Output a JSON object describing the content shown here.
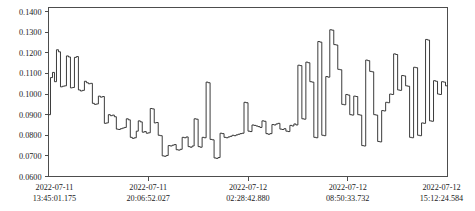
{
  "chart_data": {
    "type": "line",
    "line_style": "step-post",
    "title": "",
    "subtitle": "",
    "xlabel": "",
    "ylabel": "",
    "grid": false,
    "legend": null,
    "legend_position": "none",
    "series_color": "#262626",
    "background_color": "#ffffff",
    "axis_color": "#4d4d4d",
    "ylim": [
      0.06,
      0.142
    ],
    "yticks": [
      0.06,
      0.07,
      0.08,
      0.09,
      0.1,
      0.11,
      0.12,
      0.13,
      0.14
    ],
    "ytick_labels": [
      "0.0600",
      "0.0700",
      "0.0800",
      "0.0900",
      "0.1000",
      "0.1100",
      "0.1200",
      "0.1300",
      "0.1400"
    ],
    "xtick_labels": [
      {
        "date": "2022-07-11",
        "time": "13:45:01.175"
      },
      {
        "date": "2022-07-11",
        "time": "20:06:52.027"
      },
      {
        "date": "2022-07-12",
        "time": "02:28:42.880"
      },
      {
        "date": "2022-07-12",
        "time": "08:50:33.732"
      },
      {
        "date": "2022-07-12",
        "time": "15:12:24.584"
      }
    ],
    "xtick_positions": [
      0,
      0.25,
      0.5,
      0.75,
      1.0
    ],
    "x_range_start": "2022-07-11 13:45:01.175",
    "x_range_end": "2022-07-12 15:12:24.584",
    "n_points": 200,
    "value_min": 0.0655,
    "value_max": 0.1312,
    "values": [
      0.09,
      0.108,
      0.1105,
      0.106,
      0.1215,
      0.1205,
      0.1035,
      0.1038,
      0.104,
      0.1185,
      0.118,
      0.103,
      0.1032,
      0.1178,
      0.1182,
      0.102,
      0.1015,
      0.1018,
      0.1062,
      0.1055,
      0.105,
      0.1052,
      0.0955,
      0.095,
      0.0952,
      0.099,
      0.0985,
      0.0988,
      0.0858,
      0.086,
      0.09,
      0.0895,
      0.0898,
      0.089,
      0.083,
      0.0828,
      0.0832,
      0.0835,
      0.0838,
      0.088,
      0.0875,
      0.079,
      0.0785,
      0.0788,
      0.082,
      0.087,
      0.0865,
      0.0815,
      0.0818,
      0.081,
      0.0812,
      0.093,
      0.0928,
      0.086,
      0.0862,
      0.08,
      0.0798,
      0.07,
      0.0698,
      0.0702,
      0.075,
      0.0748,
      0.0752,
      0.0755,
      0.073,
      0.0728,
      0.0732,
      0.079,
      0.0788,
      0.0792,
      0.0745,
      0.0742,
      0.0748,
      0.088,
      0.0878,
      0.0745,
      0.0742,
      0.079,
      0.0788,
      0.1058,
      0.1055,
      0.078,
      0.0778,
      0.069,
      0.0688,
      0.0692,
      0.081,
      0.0808,
      0.079,
      0.0788,
      0.0792,
      0.0795,
      0.08,
      0.0798,
      0.0802,
      0.0805,
      0.0808,
      0.081,
      0.096,
      0.0958,
      0.082,
      0.0818,
      0.085,
      0.0848,
      0.0845,
      0.0842,
      0.0838,
      0.087,
      0.0868,
      0.0808,
      0.0805,
      0.0808,
      0.0852,
      0.085,
      0.0855,
      0.0858,
      0.083,
      0.0828,
      0.0832,
      0.082,
      0.0818,
      0.0848,
      0.0845,
      0.0855,
      0.085,
      0.114,
      0.1138,
      0.088,
      0.0878,
      0.1155,
      0.1152,
      0.106,
      0.1058,
      0.079,
      0.0788,
      0.1255,
      0.1252,
      0.08,
      0.0798,
      0.1085,
      0.1082,
      0.1312,
      0.131,
      0.124,
      0.1238,
      0.112,
      0.1118,
      0.095,
      0.0948,
      0.0998,
      0.0995,
      0.09,
      0.0898,
      0.099,
      0.0988,
      0.09,
      0.0898,
      0.075,
      0.0748,
      0.1165,
      0.1162,
      0.111,
      0.1108,
      0.09,
      0.0898,
      0.077,
      0.0768,
      0.092,
      0.0918,
      0.096,
      0.0958,
      0.1,
      0.0998,
      0.1195,
      0.1192,
      0.102,
      0.1018,
      0.109,
      0.1088,
      0.104,
      0.1038,
      0.079,
      0.0788,
      0.113,
      0.1128,
      0.08,
      0.0798,
      0.086,
      0.0858,
      0.1265,
      0.1262,
      0.087,
      0.0868,
      0.1065,
      0.1062,
      0.1,
      0.0998,
      0.106,
      0.1058,
      0.104
    ]
  }
}
